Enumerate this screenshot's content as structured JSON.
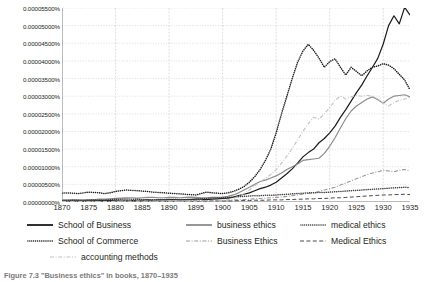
{
  "caption": "Figure 7.3  \"Business ethics\" in books, 1870–1935",
  "axes": {
    "y_ticks": [
      "0.00005500%",
      "0.00005000%",
      "0.00004500%",
      "0.00004000%",
      "0.00003500%",
      "0.00003000%",
      "0.00002500%",
      "0.00002000%",
      "0.00001500%",
      "0.00001000%",
      "0.00000500%",
      "0.00000000%"
    ],
    "x_ticks": [
      "1870",
      "1875",
      "1880",
      "1885",
      "1890",
      "1895",
      "1900",
      "1905",
      "1910",
      "1915",
      "1920",
      "1925",
      "1930",
      "1935"
    ]
  },
  "legend": {
    "items": [
      {
        "label": "School of Business",
        "style": "solid",
        "color": "#1a1a1a"
      },
      {
        "label": "business ethics",
        "style": "solid",
        "color": "#8c8c8c"
      },
      {
        "label": "medical ethics",
        "style": "dotted",
        "color": "#3d3d3d"
      },
      {
        "label": "School of Commerce",
        "style": "dotted",
        "color": "#1a1a1a"
      },
      {
        "label": "Business Ethics",
        "style": "dashdot",
        "color": "#9a9a9a"
      },
      {
        "label": "Medical Ethics",
        "style": "dashed",
        "color": "#4a4a4a"
      },
      {
        "label": "accounting methods",
        "style": "dashdot",
        "color": "#c2c2c2"
      }
    ]
  },
  "chart_data": {
    "type": "line",
    "title": "",
    "xlabel": "",
    "ylabel": "",
    "xlim": [
      1870,
      1935
    ],
    "ylim": [
      0.0,
      5.5e-05
    ],
    "ytick_step": 5e-06,
    "grid": true,
    "legend_position": "below",
    "x": [
      1870,
      1871,
      1872,
      1873,
      1874,
      1875,
      1876,
      1877,
      1878,
      1879,
      1880,
      1881,
      1882,
      1883,
      1884,
      1885,
      1886,
      1887,
      1888,
      1889,
      1890,
      1891,
      1892,
      1893,
      1894,
      1895,
      1896,
      1897,
      1898,
      1899,
      1900,
      1901,
      1902,
      1903,
      1904,
      1905,
      1906,
      1907,
      1908,
      1909,
      1910,
      1911,
      1912,
      1913,
      1914,
      1915,
      1916,
      1917,
      1918,
      1919,
      1920,
      1921,
      1922,
      1923,
      1924,
      1925,
      1926,
      1927,
      1928,
      1929,
      1930,
      1931,
      1932,
      1933,
      1934,
      1935
    ],
    "series": [
      {
        "name": "School of Business",
        "style": "solid",
        "color": "#1a1a1a",
        "values": [
          3e-07,
          3e-07,
          4e-07,
          4e-07,
          3e-07,
          4e-07,
          4e-07,
          5e-07,
          4e-07,
          4e-07,
          5e-07,
          5e-07,
          5e-07,
          4e-07,
          5e-07,
          5e-07,
          6e-07,
          5e-07,
          6e-07,
          6e-07,
          7e-07,
          7e-07,
          6e-07,
          7e-07,
          7e-07,
          8e-07,
          8e-07,
          7e-07,
          8e-07,
          9e-07,
          1e-06,
          1.1e-06,
          1.4e-06,
          1.8e-06,
          2.2e-06,
          2.6e-06,
          3.2e-06,
          3.8e-06,
          4.2e-06,
          4.8e-06,
          5.6e-06,
          6.8e-06,
          8e-06,
          9.4e-06,
          1.1e-05,
          1.28e-05,
          1.4e-05,
          1.5e-05,
          1.68e-05,
          1.8e-05,
          1.96e-05,
          2.15e-05,
          2.4e-05,
          2.62e-05,
          2.86e-05,
          3.1e-05,
          3.32e-05,
          3.58e-05,
          3.82e-05,
          4.08e-05,
          4.48e-05,
          5e-05,
          5.28e-05,
          5.05e-05,
          5.52e-05,
          5.3e-05
        ]
      },
      {
        "name": "School of Commerce",
        "style": "dotted",
        "color": "#1a1a1a",
        "values": [
          2.5e-06,
          2.6e-06,
          2.5e-06,
          2.4e-06,
          2.6e-06,
          2.8e-06,
          2.7e-06,
          2.6e-06,
          2.4e-06,
          2.6e-06,
          3e-06,
          3.2e-06,
          3.4e-06,
          3.3e-06,
          3.2e-06,
          3.1e-06,
          3e-06,
          2.8e-06,
          2.7e-06,
          2.6e-06,
          2.5e-06,
          2.4e-06,
          2.3e-06,
          2.2e-06,
          2.1e-06,
          2e-06,
          2.4e-06,
          2.8e-06,
          2.6e-06,
          2.5e-06,
          2.4e-06,
          2.6e-06,
          3e-06,
          3.6e-06,
          4.4e-06,
          5.6e-06,
          7.2e-06,
          9.2e-06,
          1.18e-05,
          1.5e-05,
          1.96e-05,
          2.5e-05,
          3e-05,
          3.5e-05,
          3.96e-05,
          4.28e-05,
          4.47e-05,
          4.3e-05,
          4.08e-05,
          3.82e-05,
          3.98e-05,
          4.06e-05,
          3.82e-05,
          3.6e-05,
          3.82e-05,
          3.7e-05,
          3.58e-05,
          3.72e-05,
          3.82e-05,
          3.86e-05,
          3.92e-05,
          3.88e-05,
          3.78e-05,
          3.62e-05,
          3.46e-05,
          3.18e-05
        ]
      },
      {
        "name": "business ethics",
        "style": "solid",
        "color": "#8c8c8c",
        "values": [
          6e-07,
          6e-07,
          7e-07,
          6e-07,
          6e-07,
          7e-07,
          7e-07,
          8e-07,
          8e-07,
          9e-07,
          1e-06,
          1.1e-06,
          1.2e-06,
          1.2e-06,
          1.1e-06,
          1.2e-06,
          1.3e-06,
          1.3e-06,
          1.2e-06,
          1.2e-06,
          1.3e-06,
          1.3e-06,
          1.2e-06,
          1.3e-06,
          1.4e-06,
          1.3e-06,
          1.2e-06,
          1.2e-06,
          1.3e-06,
          1.3e-06,
          1.4e-06,
          1.6e-06,
          2e-06,
          2.6e-06,
          3.4e-06,
          4.2e-06,
          5e-06,
          5.8e-06,
          6.2e-06,
          6.8e-06,
          7.4e-06,
          8.2e-06,
          9.2e-06,
          1e-05,
          1.08e-05,
          1.18e-05,
          1.2e-05,
          1.22e-05,
          1.24e-05,
          1.38e-05,
          1.58e-05,
          1.82e-05,
          2.1e-05,
          2.36e-05,
          2.58e-05,
          2.72e-05,
          2.82e-05,
          2.92e-05,
          2.98e-05,
          2.9e-05,
          2.8e-05,
          2.92e-05,
          3e-05,
          3.02e-05,
          3.04e-05,
          2.98e-05
        ]
      },
      {
        "name": "Business Ethics",
        "style": "dashdot",
        "color": "#9a9a9a",
        "values": [
          2e-07,
          2e-07,
          2e-07,
          2e-07,
          2e-07,
          2e-07,
          2e-07,
          2e-07,
          2e-07,
          2e-07,
          2e-07,
          3e-07,
          3e-07,
          3e-07,
          3e-07,
          3e-07,
          3e-07,
          3e-07,
          3e-07,
          3e-07,
          3e-07,
          3e-07,
          3e-07,
          3e-07,
          4e-07,
          4e-07,
          4e-07,
          4e-07,
          4e-07,
          4e-07,
          5e-07,
          5e-07,
          6e-07,
          6e-07,
          7e-07,
          8e-07,
          9e-07,
          1e-06,
          1.1e-06,
          1.2e-06,
          1.3e-06,
          1.4e-06,
          1.6e-06,
          1.8e-06,
          2e-06,
          2.2e-06,
          2.4e-06,
          2.6e-06,
          3e-06,
          3.4e-06,
          3.8e-06,
          4.2e-06,
          4.8e-06,
          5.4e-06,
          6e-06,
          6.6e-06,
          7.2e-06,
          7.8e-06,
          8.2e-06,
          8.6e-06,
          9e-06,
          8.8e-06,
          8.6e-06,
          9e-06,
          9.2e-06,
          8.8e-06
        ]
      },
      {
        "name": "medical ethics",
        "style": "dotted",
        "color": "#3d3d3d",
        "values": [
          4e-07,
          4e-07,
          5e-07,
          5e-07,
          4e-07,
          5e-07,
          6e-07,
          6e-07,
          6e-07,
          7e-07,
          8e-07,
          8e-07,
          9e-07,
          8e-07,
          8e-07,
          7e-07,
          7e-07,
          6e-07,
          7e-07,
          7e-07,
          8e-07,
          8e-07,
          7e-07,
          7e-07,
          8e-07,
          8e-07,
          9e-07,
          1e-06,
          1.1e-06,
          1.1e-06,
          1.2e-06,
          1.3e-06,
          1.4e-06,
          1.5e-06,
          1.6e-06,
          1.7e-06,
          1.8e-06,
          1.8e-06,
          1.9e-06,
          1.9e-06,
          2e-06,
          2.1e-06,
          2.2e-06,
          2.3e-06,
          2.4e-06,
          2.5e-06,
          2.6e-06,
          2.6e-06,
          2.7e-06,
          2.7e-06,
          2.8e-06,
          2.9e-06,
          3e-06,
          3.1e-06,
          3.2e-06,
          3.3e-06,
          3.4e-06,
          3.5e-06,
          3.6e-06,
          3.7e-06,
          3.8e-06,
          3.9e-06,
          4e-06,
          4.1e-06,
          4.2e-06,
          4.1e-06
        ]
      },
      {
        "name": "Medical Ethics",
        "style": "dashed",
        "color": "#4a4a4a",
        "values": [
          1e-07,
          1e-07,
          1e-07,
          1e-07,
          1e-07,
          1e-07,
          1e-07,
          1e-07,
          1e-07,
          1e-07,
          2e-07,
          2e-07,
          2e-07,
          2e-07,
          2e-07,
          2e-07,
          2e-07,
          2e-07,
          2e-07,
          2e-07,
          2e-07,
          2e-07,
          2e-07,
          2e-07,
          2e-07,
          2e-07,
          2e-07,
          2e-07,
          3e-07,
          3e-07,
          3e-07,
          3e-07,
          3e-07,
          4e-07,
          4e-07,
          4e-07,
          5e-07,
          5e-07,
          5e-07,
          6e-07,
          6e-07,
          6e-07,
          7e-07,
          7e-07,
          8e-07,
          8e-07,
          9e-07,
          9e-07,
          1e-06,
          1e-06,
          1.1e-06,
          1.2e-06,
          1.2e-06,
          1.3e-06,
          1.4e-06,
          1.5e-06,
          1.6e-06,
          1.7e-06,
          1.8e-06,
          1.9e-06,
          2e-06,
          2e-06,
          2.1e-06,
          2.1e-06,
          2.2e-06,
          2.1e-06
        ]
      },
      {
        "name": "accounting methods",
        "style": "dashdot",
        "color": "#c2c2c2",
        "values": [
          1e-07,
          1e-07,
          1e-07,
          1e-07,
          1e-07,
          1e-07,
          1e-07,
          1e-07,
          1e-07,
          1e-07,
          1e-07,
          2e-07,
          2e-07,
          2e-07,
          2e-07,
          2e-07,
          2e-07,
          2e-07,
          2e-07,
          2e-07,
          2e-07,
          2e-07,
          2e-07,
          2e-07,
          2e-07,
          2e-07,
          3e-07,
          3e-07,
          3e-07,
          3e-07,
          4e-07,
          6e-07,
          1e-06,
          1.6e-06,
          2.4e-06,
          3.4e-06,
          4.6e-06,
          5.8e-06,
          6.6e-06,
          7.8e-06,
          9.2e-06,
          1.1e-05,
          1.3e-05,
          1.52e-05,
          1.76e-05,
          2e-05,
          2.22e-05,
          2.4e-05,
          2.35e-05,
          2.5e-05,
          2.68e-05,
          2.88e-05,
          3e-05,
          2.92e-05,
          2.98e-05,
          3.02e-05,
          3e-05,
          3.02e-05,
          3e-05,
          2.92e-05,
          2.8e-05,
          2.72e-05,
          2.82e-05,
          2.88e-05,
          2.92e-05,
          2.96e-05
        ]
      }
    ]
  }
}
